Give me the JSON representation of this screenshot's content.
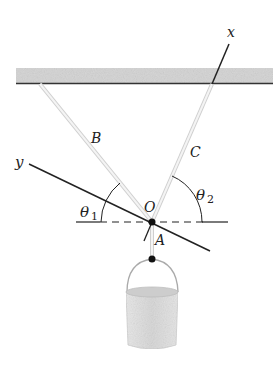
{
  "labels": {
    "x_axis": "x",
    "y_axis": "y",
    "cable_b": "B",
    "cable_c": "C",
    "cable_a": "A",
    "origin": "O",
    "theta1": "θ",
    "theta1_sub": "1",
    "theta2": "θ",
    "theta2_sub": "2"
  },
  "colors": {
    "ceiling_fill": "#d4d4d4",
    "ceiling_edge": "#333333",
    "cable": "#e2e2e2",
    "axis": "#222222",
    "bucket": "#e4e4e4"
  }
}
